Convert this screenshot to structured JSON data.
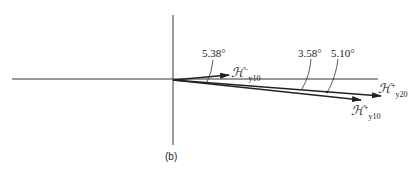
{
  "figure": {
    "caption": "(b)",
    "angles": {
      "a1": "5.38°",
      "a2": "3.58°",
      "a3": "5.10°"
    },
    "vectors": {
      "h_minus_y10": {
        "symbol": "ℋ",
        "sup": "−",
        "sub": "y10"
      },
      "h_plus_y20": {
        "symbol": "ℋ",
        "sup": "+",
        "sub": "y20"
      },
      "h_plus_y10": {
        "symbol": "ℋ",
        "sup": "+",
        "sub": "y10"
      }
    }
  }
}
